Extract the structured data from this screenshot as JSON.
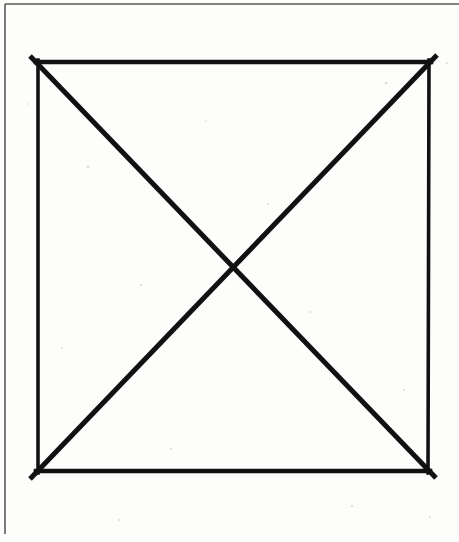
{
  "figure": {
    "description": "A hand-drawn black square outline with two straight diagonal lines connecting opposite corners, crossing at the centre.",
    "canvas": {
      "width": 459,
      "height": 542,
      "background_color": "#fdfdfc"
    },
    "page_frame": {
      "name": "scan-page-border",
      "stroke_color": "#5a5a5a",
      "stroke_width": 1.6,
      "top_edge_y": 4,
      "left_edge_x": 5,
      "left_edge_end_y": 534
    },
    "square": {
      "stroke_color": "#111111",
      "stroke_width_horizontal": 4.6,
      "stroke_width_vertical": 3.6,
      "corners": {
        "top_left": [
          38,
          62
        ],
        "top_right": [
          429,
          62
        ],
        "bottom_right": [
          428,
          471
        ],
        "bottom_left": [
          38,
          471
        ]
      },
      "width_px": 391,
      "height_px": 409
    },
    "diagonals": {
      "stroke_color": "#111111",
      "stroke_width": 5.0,
      "intersection_point": [
        233,
        266
      ],
      "lines": [
        {
          "name": "diagonal-top-left-to-bottom-right",
          "start": [
            30,
            56
          ],
          "end": [
            436,
            478
          ]
        },
        {
          "name": "diagonal-top-right-to-bottom-left",
          "start": [
            437,
            55
          ],
          "end": [
            30,
            479
          ]
        }
      ]
    },
    "speckles": [
      [
        88,
        167,
        1.3
      ],
      [
        141,
        285,
        1.1
      ],
      [
        386,
        83,
        1.2
      ],
      [
        447,
        63,
        1.0
      ],
      [
        310,
        312,
        1.0
      ],
      [
        171,
        449,
        1.1
      ],
      [
        62,
        348,
        0.9
      ],
      [
        268,
        204,
        0.9
      ],
      [
        404,
        390,
        1.0
      ],
      [
        206,
        121,
        0.8
      ],
      [
        352,
        506,
        1.1
      ],
      [
        119,
        520,
        0.9
      ],
      [
        430,
        517,
        1.0
      ],
      [
        28,
        104,
        0.8
      ]
    ]
  }
}
